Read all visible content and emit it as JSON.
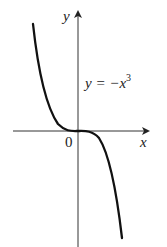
{
  "figure": {
    "type": "function-graph",
    "equation_lhs": "y = −x",
    "equation_exp": "3",
    "x_axis_label": "x",
    "y_axis_label": "y",
    "origin_label": "0",
    "colors": {
      "curve": "#111111",
      "axes": "#333333",
      "text": "#222222"
    }
  }
}
